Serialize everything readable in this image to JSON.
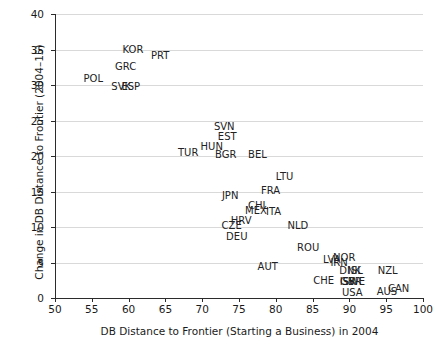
{
  "chart_data": {
    "type": "scatter",
    "title": "",
    "xlabel": "DB Distance to Frontier (Starting a Business) in 2004",
    "ylabel": "Change in DB Distance to Frontier (2004–15)",
    "xlim": [
      50,
      100
    ],
    "ylim": [
      0,
      40
    ],
    "xticks": [
      50,
      55,
      60,
      65,
      70,
      75,
      80,
      85,
      90,
      95,
      100
    ],
    "yticks": [
      0,
      5,
      10,
      15,
      20,
      25,
      30,
      35,
      40
    ],
    "grid": "horizontal",
    "legend": "none",
    "marker_style": "text-labels-only",
    "points": [
      {
        "label": "KOR",
        "x": 60.6,
        "y": 35.0
      },
      {
        "label": "PRT",
        "x": 64.3,
        "y": 34.1
      },
      {
        "label": "GRC",
        "x": 59.6,
        "y": 32.6
      },
      {
        "label": "POL",
        "x": 55.2,
        "y": 30.8
      },
      {
        "label": "SVK",
        "x": 59.0,
        "y": 29.7
      },
      {
        "label": "ESP",
        "x": 60.3,
        "y": 29.7
      },
      {
        "label": "SVN",
        "x": 73.0,
        "y": 24.1
      },
      {
        "label": "EST",
        "x": 73.4,
        "y": 22.7
      },
      {
        "label": "HUN",
        "x": 71.3,
        "y": 21.2
      },
      {
        "label": "TUR",
        "x": 68.1,
        "y": 20.4
      },
      {
        "label": "BGR",
        "x": 73.2,
        "y": 20.2
      },
      {
        "label": "BEL",
        "x": 77.5,
        "y": 20.1
      },
      {
        "label": "LTU",
        "x": 81.2,
        "y": 17.1
      },
      {
        "label": "FRA",
        "x": 79.3,
        "y": 15.1
      },
      {
        "label": "JPN",
        "x": 73.8,
        "y": 14.3
      },
      {
        "label": "CHL",
        "x": 77.6,
        "y": 13.0
      },
      {
        "label": "MEX",
        "x": 77.3,
        "y": 12.3
      },
      {
        "label": "ITA",
        "x": 79.7,
        "y": 12.1
      },
      {
        "label": "HRV",
        "x": 75.3,
        "y": 10.8
      },
      {
        "label": "CZE",
        "x": 74.0,
        "y": 10.1
      },
      {
        "label": "NLD",
        "x": 83.0,
        "y": 10.2
      },
      {
        "label": "DEU",
        "x": 74.7,
        "y": 8.6
      },
      {
        "label": "ROU",
        "x": 84.4,
        "y": 7.1
      },
      {
        "label": "LVA",
        "x": 87.6,
        "y": 5.3
      },
      {
        "label": "NOR",
        "x": 89.3,
        "y": 5.7
      },
      {
        "label": "IRN",
        "x": 88.6,
        "y": 5.0
      },
      {
        "label": "AUT",
        "x": 78.9,
        "y": 4.3
      },
      {
        "label": "DNK",
        "x": 90.1,
        "y": 3.8
      },
      {
        "label": "ISL",
        "x": 90.8,
        "y": 3.8
      },
      {
        "label": "NZL",
        "x": 95.2,
        "y": 3.8
      },
      {
        "label": "CHE",
        "x": 86.5,
        "y": 2.4
      },
      {
        "label": "ISR",
        "x": 89.8,
        "y": 2.3
      },
      {
        "label": "SWE",
        "x": 90.6,
        "y": 2.3
      },
      {
        "label": "GBR",
        "x": 90.2,
        "y": 2.3
      },
      {
        "label": "USA",
        "x": 90.4,
        "y": 0.7
      },
      {
        "label": "AUS",
        "x": 95.1,
        "y": 0.8
      },
      {
        "label": "CAN",
        "x": 96.7,
        "y": 1.2
      }
    ]
  }
}
